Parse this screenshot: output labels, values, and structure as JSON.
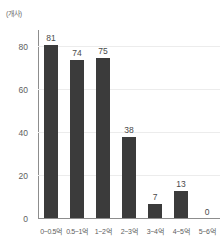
{
  "chart_data": {
    "type": "bar",
    "title": "",
    "subtitle": "",
    "unit_label": "(개사)",
    "xlabel": "",
    "ylabel": "",
    "categories": [
      "0~0.5억",
      "0.5~1억",
      "1~2억",
      "2~3억",
      "3~4억",
      "4~5억",
      "5~6억"
    ],
    "values": [
      81,
      74,
      75,
      38,
      7,
      13,
      0
    ],
    "value_labels": [
      "81",
      "74",
      "75",
      "38",
      "7",
      "13",
      "0"
    ],
    "ylim": [
      0,
      88
    ],
    "yticks": [
      0,
      20,
      40,
      60,
      80
    ],
    "ytick_labels": [
      "0",
      "20",
      "40",
      "60",
      "80"
    ],
    "grid": true,
    "grid_axis": "y",
    "legend": false,
    "legend_position": "none",
    "series": [
      {
        "name": "",
        "values": [
          81,
          74,
          75,
          38,
          7,
          13,
          0
        ]
      }
    ],
    "colors": {
      "bar": "#3b3b3b",
      "gridline": "#ececec",
      "axis": "#8d8d8d",
      "tick_text": "#5e5e5e",
      "value_text": "#4a4a4a",
      "background": "#ffffff"
    }
  }
}
